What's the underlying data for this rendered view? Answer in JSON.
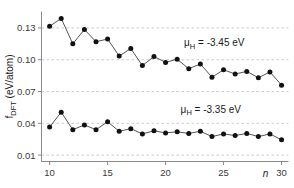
{
  "chart_data": {
    "type": "line",
    "title": "",
    "xlabel": "n",
    "ylabel": "f_DFT (eV/atom)",
    "ylabel_main": "f",
    "ylabel_sub": "DFT",
    "ylabel_unit": " (eV/atom)",
    "x": [
      10,
      11,
      12,
      13,
      14,
      15,
      16,
      17,
      18,
      19,
      20,
      21,
      22,
      23,
      24,
      25,
      26,
      27,
      28,
      29,
      30
    ],
    "xlim": [
      9.3,
      30.6
    ],
    "ylim": [
      0.004,
      0.1455
    ],
    "xticks": [
      10,
      15,
      20,
      25,
      30
    ],
    "xtick_labels": [
      "10",
      "15",
      "20",
      "25",
      "30"
    ],
    "yticks": [
      0.01,
      0.04,
      0.07,
      0.1,
      0.13
    ],
    "ytick_labels": [
      "0.01",
      "0.04",
      "0.07",
      "0.10",
      "0.13"
    ],
    "grid": true,
    "grid_style": "dashed-horizontal",
    "marker": "filled-circle",
    "marker_color": "#111111",
    "line_color": "#555555",
    "series": [
      {
        "name": "mu_H = -3.45 eV",
        "label": "μ",
        "label_sub": "H",
        "label_rest": " = -3.45 eV",
        "annotation_x": 24.2,
        "annotation_y": 0.1125,
        "values": [
          0.1315,
          0.139,
          0.115,
          0.1285,
          0.117,
          0.1195,
          0.1035,
          0.1105,
          0.0945,
          0.103,
          0.0975,
          0.1005,
          0.0915,
          0.096,
          0.0835,
          0.0905,
          0.0865,
          0.089,
          0.083,
          0.0885,
          0.076
        ]
      },
      {
        "name": "mu_H = -3.35 eV",
        "label": "μ",
        "label_sub": "H",
        "label_rest": " = -3.35 eV",
        "annotation_x": 23.9,
        "annotation_y": 0.05,
        "values": [
          0.0365,
          0.0505,
          0.034,
          0.0385,
          0.034,
          0.0415,
          0.0325,
          0.035,
          0.03,
          0.033,
          0.031,
          0.032,
          0.0305,
          0.0325,
          0.0275,
          0.03,
          0.0285,
          0.0305,
          0.0275,
          0.03,
          0.0245
        ]
      }
    ]
  }
}
